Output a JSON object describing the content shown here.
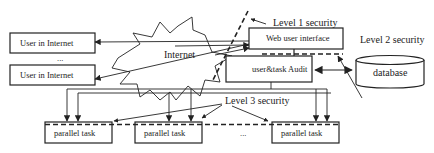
{
  "diagram": {
    "nodes": {
      "user1": {
        "label": "User in Internet"
      },
      "user_ellipsis": {
        "label": "..."
      },
      "user2": {
        "label": "User in Internet"
      },
      "internet": {
        "label": "Internet"
      },
      "web_ui": {
        "label": "Web user interface"
      },
      "audit": {
        "label": "user&task Audit"
      },
      "database": {
        "label": "database"
      },
      "task1": {
        "label": "parallel task"
      },
      "task2": {
        "label": "parallel task"
      },
      "task_ellipsis": {
        "label": "..."
      },
      "task3": {
        "label": "parallel task"
      }
    },
    "annotations": {
      "level1": "Level 1 security",
      "level2": "Level 2 security",
      "level3": "Level 3 security"
    },
    "edges": [
      {
        "from": "web_ui",
        "to": "user1",
        "type": "arrow"
      },
      {
        "from": "web_ui",
        "to": "user2",
        "type": "arrow"
      },
      {
        "from": "user1",
        "to": "web_ui",
        "type": "arrow"
      },
      {
        "from": "user2",
        "to": "web_ui",
        "type": "arrow"
      },
      {
        "from": "web_ui",
        "to": "audit",
        "type": "line"
      },
      {
        "from": "audit",
        "to": "database",
        "type": "bidirectional"
      },
      {
        "from": "audit",
        "to": "task1",
        "type": "bus-arrow"
      },
      {
        "from": "audit",
        "to": "task2",
        "type": "bus-arrow"
      },
      {
        "from": "audit",
        "to": "task3",
        "type": "bus-arrow"
      }
    ]
  }
}
